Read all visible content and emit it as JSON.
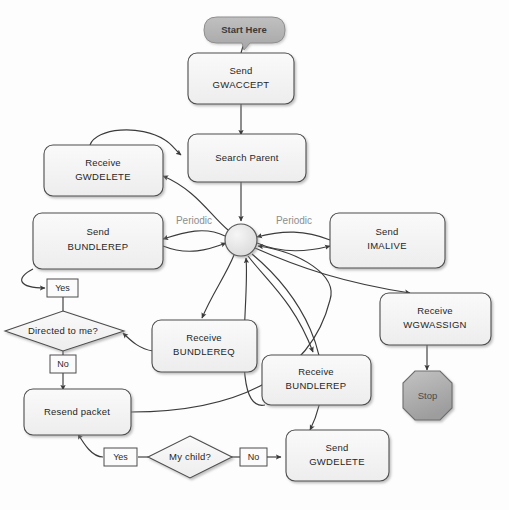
{
  "diagram": {
    "background_color": "#fdfdfd",
    "node_fill": "#f2f2f2",
    "node_stroke": "#4a4a4a",
    "start_fill": "#b3b3b3",
    "stop_fill": "#adadad",
    "hub_fill": "#e2e2e2",
    "edge_color": "#3b3b3b",
    "periodic_label_color": "#8d8d8d"
  },
  "nodes": {
    "start": {
      "id": "start",
      "shape": "rounded-callout",
      "label": "Start Here"
    },
    "send_gwaccept": {
      "id": "send_gwaccept",
      "shape": "process",
      "line1": "Send",
      "line2": "GWACCEPT"
    },
    "search_parent": {
      "id": "search_parent",
      "shape": "process",
      "line1": "Search Parent",
      "line2": ""
    },
    "receive_gwdelete": {
      "id": "receive_gwdelete",
      "shape": "process",
      "line1": "Receive",
      "line2": "GWDELETE"
    },
    "send_bundlerep": {
      "id": "send_bundlerep",
      "shape": "process",
      "line1": "Send",
      "line2": "BUNDLEREP"
    },
    "send_imalive": {
      "id": "send_imalive",
      "shape": "process",
      "line1": "Send",
      "line2": "IMALIVE"
    },
    "hub": {
      "id": "hub",
      "shape": "circle",
      "label": ""
    },
    "receive_wgwassign": {
      "id": "receive_wgwassign",
      "shape": "process",
      "line1": "Receive",
      "line2": "WGWASSIGN"
    },
    "stop": {
      "id": "stop",
      "shape": "octagon",
      "label": "Stop"
    },
    "receive_bundlereq": {
      "id": "receive_bundlereq",
      "shape": "process",
      "line1": "Receive",
      "line2": "BUNDLEREQ"
    },
    "receive_bundlerep": {
      "id": "receive_bundlerep",
      "shape": "process",
      "line1": "Receive",
      "line2": "BUNDLEREP"
    },
    "directed_to_me": {
      "id": "directed_to_me",
      "shape": "decision",
      "label": "Directed to me?"
    },
    "resend_packet": {
      "id": "resend_packet",
      "shape": "process",
      "line1": "Resend packet",
      "line2": ""
    },
    "my_child": {
      "id": "my_child",
      "shape": "decision",
      "label": "My child?"
    },
    "send_gwdelete": {
      "id": "send_gwdelete",
      "shape": "process",
      "line1": "Send",
      "line2": "GWDELETE"
    }
  },
  "edge_labels": {
    "periodic_left": "Periodic",
    "periodic_right": "Periodic",
    "directed_yes": "Yes",
    "directed_no": "No",
    "mychild_yes": "Yes",
    "mychild_no": "No"
  },
  "edges": [
    {
      "from": "start",
      "to": "send_gwaccept",
      "label": ""
    },
    {
      "from": "send_gwaccept",
      "to": "search_parent",
      "label": ""
    },
    {
      "from": "search_parent",
      "to": "hub",
      "label": ""
    },
    {
      "from": "receive_gwdelete",
      "to": "search_parent",
      "label": ""
    },
    {
      "from": "hub",
      "to": "receive_gwdelete",
      "label": ""
    },
    {
      "from": "hub",
      "to": "send_bundlerep",
      "label": "Periodic"
    },
    {
      "from": "send_bundlerep",
      "to": "hub",
      "label": ""
    },
    {
      "from": "send_imalive",
      "to": "hub",
      "label": "Periodic"
    },
    {
      "from": "hub",
      "to": "send_imalive",
      "label": ""
    },
    {
      "from": "hub",
      "to": "receive_wgwassign",
      "label": ""
    },
    {
      "from": "receive_wgwassign",
      "to": "stop",
      "label": ""
    },
    {
      "from": "hub",
      "to": "receive_bundlereq",
      "label": ""
    },
    {
      "from": "hub",
      "to": "receive_bundlerep",
      "label": ""
    },
    {
      "from": "hub",
      "to": "send_gwdelete",
      "label": ""
    },
    {
      "from": "receive_bundlereq",
      "to": "directed_to_me",
      "label": ""
    },
    {
      "from": "receive_bundlerep",
      "to": "hub",
      "label": ""
    },
    {
      "from": "send_bundlerep",
      "to": "directed_to_me",
      "label": "Yes"
    },
    {
      "from": "directed_to_me",
      "to": "resend_packet",
      "label": "No"
    },
    {
      "from": "resend_packet",
      "to": "hub",
      "label": ""
    },
    {
      "from": "my_child",
      "to": "resend_packet",
      "label": "Yes"
    },
    {
      "from": "my_child",
      "to": "send_gwdelete",
      "label": "No"
    }
  ]
}
